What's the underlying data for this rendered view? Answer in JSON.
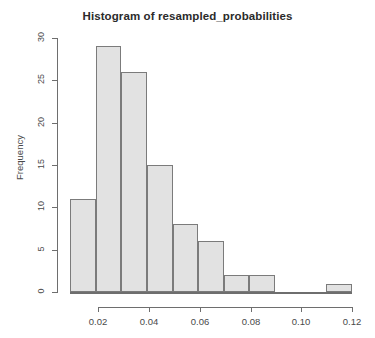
{
  "chart_data": {
    "type": "bar",
    "title": "Histogram of resampled_probabilities",
    "xlabel": "",
    "ylabel": "Frequency",
    "bin_width": 0.01,
    "bin_edges": [
      0.01,
      0.02,
      0.03,
      0.04,
      0.05,
      0.06,
      0.07,
      0.08,
      0.09,
      0.1,
      0.11,
      0.12
    ],
    "categories": [
      "0.01-0.02",
      "0.02-0.03",
      "0.03-0.04",
      "0.04-0.05",
      "0.05-0.06",
      "0.06-0.07",
      "0.07-0.08",
      "0.08-0.09",
      "0.09-0.10",
      "0.10-0.11",
      "0.11-0.12"
    ],
    "values": [
      11,
      29,
      26,
      15,
      8,
      6,
      2,
      2,
      0,
      0,
      1
    ],
    "xlim": [
      0.01,
      0.12
    ],
    "ylim": [
      0,
      30
    ],
    "xticks": [
      0.02,
      0.04,
      0.06,
      0.08,
      0.1,
      0.12
    ],
    "xtick_labels": [
      "0.02",
      "0.04",
      "0.06",
      "0.08",
      "0.10",
      "0.12"
    ],
    "yticks": [
      0,
      5,
      10,
      15,
      20,
      25,
      30
    ],
    "ytick_labels": [
      "0",
      "5",
      "10",
      "15",
      "20",
      "25",
      "30"
    ],
    "grid": false,
    "legend": false,
    "bar_fill_color": "#e2e2e2",
    "bar_border_color": "#7b7b7b",
    "axis_color": "#6e6e6e",
    "background_color": "#ffffff"
  }
}
